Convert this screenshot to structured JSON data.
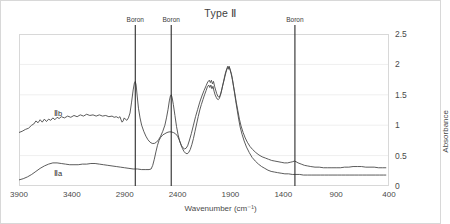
{
  "chart_data": {
    "type": "line",
    "title": "Type Ⅱ",
    "xlabel": "Wavenumber (cm⁻¹)",
    "ylabel": "Absorbance",
    "xlim": [
      3900,
      400
    ],
    "ylim": [
      0,
      2.5
    ],
    "x_ticks": [
      3900,
      3400,
      2900,
      2400,
      1900,
      1400,
      900,
      400
    ],
    "y_ticks": [
      0,
      0.5,
      1,
      1.5,
      2,
      2.5
    ],
    "x_reversed": true,
    "grid": "horizontal",
    "legend": "inline-labels",
    "annotations": [
      {
        "label": "Boron",
        "x": 2800,
        "type": "vertical-line"
      },
      {
        "label": "Boron",
        "x": 2460,
        "type": "vertical-line"
      },
      {
        "label": "Boron",
        "x": 1290,
        "type": "vertical-line"
      }
    ],
    "series": [
      {
        "name": "Ⅱb",
        "label_x": 3530,
        "label_y": 1.2,
        "noisy": true,
        "color": "#4a4a4a",
        "points": [
          [
            3900,
            0.88
          ],
          [
            3870,
            0.9
          ],
          [
            3840,
            0.93
          ],
          [
            3810,
            0.95
          ],
          [
            3780,
            1.0
          ],
          [
            3760,
            1.02
          ],
          [
            3740,
            1.07
          ],
          [
            3720,
            1.04
          ],
          [
            3700,
            1.09
          ],
          [
            3680,
            1.05
          ],
          [
            3660,
            1.1
          ],
          [
            3640,
            1.06
          ],
          [
            3620,
            1.1
          ],
          [
            3600,
            1.08
          ],
          [
            3580,
            1.12
          ],
          [
            3560,
            1.09
          ],
          [
            3540,
            1.13
          ],
          [
            3520,
            1.11
          ],
          [
            3500,
            1.14
          ],
          [
            3470,
            1.12
          ],
          [
            3440,
            1.15
          ],
          [
            3410,
            1.13
          ],
          [
            3380,
            1.16
          ],
          [
            3350,
            1.14
          ],
          [
            3320,
            1.17
          ],
          [
            3290,
            1.15
          ],
          [
            3260,
            1.18
          ],
          [
            3230,
            1.16
          ],
          [
            3200,
            1.17
          ],
          [
            3170,
            1.15
          ],
          [
            3140,
            1.17
          ],
          [
            3110,
            1.15
          ],
          [
            3080,
            1.16
          ],
          [
            3050,
            1.14
          ],
          [
            3020,
            1.15
          ],
          [
            3000,
            1.13
          ],
          [
            2980,
            1.14
          ],
          [
            2960,
            1.12
          ],
          [
            2945,
            1.14
          ],
          [
            2935,
            1.09
          ],
          [
            2925,
            1.05
          ],
          [
            2915,
            1.07
          ],
          [
            2905,
            1.12
          ],
          [
            2895,
            1.1
          ],
          [
            2880,
            1.08
          ],
          [
            2865,
            1.12
          ],
          [
            2850,
            1.2
          ],
          [
            2835,
            1.38
          ],
          [
            2820,
            1.58
          ],
          [
            2808,
            1.7
          ],
          [
            2800,
            1.72
          ],
          [
            2792,
            1.66
          ],
          [
            2782,
            1.48
          ],
          [
            2770,
            1.28
          ],
          [
            2755,
            1.12
          ],
          [
            2740,
            1.0
          ],
          [
            2720,
            0.9
          ],
          [
            2700,
            0.82
          ],
          [
            2680,
            0.76
          ],
          [
            2660,
            0.72
          ],
          [
            2640,
            0.7
          ],
          [
            2620,
            0.7
          ],
          [
            2600,
            0.72
          ],
          [
            2580,
            0.76
          ],
          [
            2560,
            0.82
          ],
          [
            2540,
            0.9
          ],
          [
            2520,
            1.0
          ],
          [
            2505,
            1.12
          ],
          [
            2490,
            1.26
          ],
          [
            2478,
            1.4
          ],
          [
            2468,
            1.48
          ],
          [
            2460,
            1.5
          ],
          [
            2452,
            1.46
          ],
          [
            2440,
            1.34
          ],
          [
            2425,
            1.16
          ],
          [
            2410,
            0.98
          ],
          [
            2395,
            0.84
          ],
          [
            2380,
            0.74
          ],
          [
            2365,
            0.67
          ],
          [
            2350,
            0.63
          ],
          [
            2335,
            0.61
          ],
          [
            2320,
            0.62
          ],
          [
            2305,
            0.66
          ],
          [
            2290,
            0.74
          ],
          [
            2270,
            0.86
          ],
          [
            2250,
            1.0
          ],
          [
            2230,
            1.14
          ],
          [
            2210,
            1.26
          ],
          [
            2190,
            1.38
          ],
          [
            2170,
            1.48
          ],
          [
            2150,
            1.57
          ],
          [
            2130,
            1.65
          ],
          [
            2115,
            1.71
          ],
          [
            2100,
            1.74
          ],
          [
            2090,
            1.7
          ],
          [
            2080,
            1.74
          ],
          [
            2070,
            1.68
          ],
          [
            2060,
            1.72
          ],
          [
            2050,
            1.64
          ],
          [
            2040,
            1.58
          ],
          [
            2030,
            1.52
          ],
          [
            2020,
            1.48
          ],
          [
            2010,
            1.46
          ],
          [
            2000,
            1.48
          ],
          [
            1990,
            1.53
          ],
          [
            1980,
            1.6
          ],
          [
            1970,
            1.68
          ],
          [
            1960,
            1.76
          ],
          [
            1950,
            1.84
          ],
          [
            1940,
            1.9
          ],
          [
            1932,
            1.94
          ],
          [
            1925,
            1.97
          ],
          [
            1918,
            1.94
          ],
          [
            1912,
            1.97
          ],
          [
            1905,
            1.93
          ],
          [
            1898,
            1.89
          ],
          [
            1890,
            1.84
          ],
          [
            1880,
            1.75
          ],
          [
            1870,
            1.64
          ],
          [
            1858,
            1.52
          ],
          [
            1845,
            1.38
          ],
          [
            1830,
            1.24
          ],
          [
            1815,
            1.1
          ],
          [
            1800,
            0.99
          ],
          [
            1780,
            0.88
          ],
          [
            1760,
            0.79
          ],
          [
            1740,
            0.72
          ],
          [
            1715,
            0.65
          ],
          [
            1690,
            0.6
          ],
          [
            1660,
            0.55
          ],
          [
            1630,
            0.51
          ],
          [
            1600,
            0.48
          ],
          [
            1570,
            0.46
          ],
          [
            1540,
            0.44
          ],
          [
            1510,
            0.42
          ],
          [
            1480,
            0.41
          ],
          [
            1450,
            0.4
          ],
          [
            1420,
            0.39
          ],
          [
            1390,
            0.38
          ],
          [
            1360,
            0.38
          ],
          [
            1335,
            0.39
          ],
          [
            1310,
            0.4
          ],
          [
            1295,
            0.41
          ],
          [
            1280,
            0.4
          ],
          [
            1260,
            0.38
          ],
          [
            1230,
            0.36
          ],
          [
            1200,
            0.34
          ],
          [
            1170,
            0.33
          ],
          [
            1140,
            0.32
          ],
          [
            1100,
            0.31
          ],
          [
            1060,
            0.31
          ],
          [
            1020,
            0.3
          ],
          [
            980,
            0.3
          ],
          [
            940,
            0.3
          ],
          [
            900,
            0.3
          ],
          [
            860,
            0.3
          ],
          [
            820,
            0.31
          ],
          [
            780,
            0.31
          ],
          [
            740,
            0.32
          ],
          [
            700,
            0.32
          ],
          [
            660,
            0.32
          ],
          [
            620,
            0.31
          ],
          [
            580,
            0.31
          ],
          [
            540,
            0.31
          ],
          [
            500,
            0.3
          ],
          [
            460,
            0.3
          ],
          [
            430,
            0.3
          ]
        ]
      },
      {
        "name": "Ⅱa",
        "label_x": 3530,
        "label_y": 0.22,
        "noisy": false,
        "color": "#4a4a4a",
        "points": [
          [
            3900,
            0.1
          ],
          [
            3860,
            0.12
          ],
          [
            3820,
            0.15
          ],
          [
            3780,
            0.19
          ],
          [
            3740,
            0.24
          ],
          [
            3700,
            0.29
          ],
          [
            3660,
            0.33
          ],
          [
            3620,
            0.36
          ],
          [
            3580,
            0.38
          ],
          [
            3540,
            0.38
          ],
          [
            3500,
            0.37
          ],
          [
            3460,
            0.36
          ],
          [
            3420,
            0.35
          ],
          [
            3380,
            0.35
          ],
          [
            3340,
            0.35
          ],
          [
            3300,
            0.36
          ],
          [
            3260,
            0.36
          ],
          [
            3220,
            0.37
          ],
          [
            3180,
            0.37
          ],
          [
            3140,
            0.36
          ],
          [
            3100,
            0.35
          ],
          [
            3060,
            0.34
          ],
          [
            3020,
            0.33
          ],
          [
            2980,
            0.32
          ],
          [
            2940,
            0.31
          ],
          [
            2900,
            0.3
          ],
          [
            2860,
            0.29
          ],
          [
            2820,
            0.28
          ],
          [
            2780,
            0.28
          ],
          [
            2740,
            0.27
          ],
          [
            2700,
            0.27
          ],
          [
            2670,
            0.27
          ],
          [
            2650,
            0.28
          ],
          [
            2635,
            0.34
          ],
          [
            2620,
            0.44
          ],
          [
            2605,
            0.56
          ],
          [
            2590,
            0.67
          ],
          [
            2575,
            0.75
          ],
          [
            2560,
            0.8
          ],
          [
            2540,
            0.84
          ],
          [
            2520,
            0.86
          ],
          [
            2500,
            0.88
          ],
          [
            2480,
            0.89
          ],
          [
            2460,
            0.89
          ],
          [
            2440,
            0.88
          ],
          [
            2420,
            0.86
          ],
          [
            2400,
            0.82
          ],
          [
            2385,
            0.76
          ],
          [
            2370,
            0.69
          ],
          [
            2355,
            0.62
          ],
          [
            2340,
            0.57
          ],
          [
            2325,
            0.54
          ],
          [
            2310,
            0.53
          ],
          [
            2295,
            0.55
          ],
          [
            2280,
            0.6
          ],
          [
            2265,
            0.68
          ],
          [
            2250,
            0.78
          ],
          [
            2235,
            0.9
          ],
          [
            2220,
            1.02
          ],
          [
            2205,
            1.14
          ],
          [
            2190,
            1.25
          ],
          [
            2175,
            1.34
          ],
          [
            2160,
            1.42
          ],
          [
            2145,
            1.5
          ],
          [
            2130,
            1.57
          ],
          [
            2118,
            1.63
          ],
          [
            2105,
            1.66
          ],
          [
            2095,
            1.62
          ],
          [
            2085,
            1.66
          ],
          [
            2075,
            1.6
          ],
          [
            2065,
            1.64
          ],
          [
            2055,
            1.56
          ],
          [
            2045,
            1.5
          ],
          [
            2035,
            1.46
          ],
          [
            2025,
            1.43
          ],
          [
            2015,
            1.42
          ],
          [
            2005,
            1.44
          ],
          [
            1995,
            1.49
          ],
          [
            1985,
            1.56
          ],
          [
            1975,
            1.64
          ],
          [
            1963,
            1.72
          ],
          [
            1952,
            1.8
          ],
          [
            1942,
            1.87
          ],
          [
            1933,
            1.92
          ],
          [
            1925,
            1.95
          ],
          [
            1917,
            1.92
          ],
          [
            1910,
            1.95
          ],
          [
            1902,
            1.9
          ],
          [
            1894,
            1.85
          ],
          [
            1885,
            1.78
          ],
          [
            1875,
            1.68
          ],
          [
            1863,
            1.55
          ],
          [
            1850,
            1.4
          ],
          [
            1836,
            1.25
          ],
          [
            1822,
            1.1
          ],
          [
            1808,
            0.97
          ],
          [
            1790,
            0.85
          ],
          [
            1770,
            0.74
          ],
          [
            1748,
            0.64
          ],
          [
            1722,
            0.55
          ],
          [
            1695,
            0.47
          ],
          [
            1665,
            0.41
          ],
          [
            1635,
            0.36
          ],
          [
            1605,
            0.32
          ],
          [
            1575,
            0.29
          ],
          [
            1545,
            0.26
          ],
          [
            1515,
            0.24
          ],
          [
            1485,
            0.23
          ],
          [
            1455,
            0.22
          ],
          [
            1420,
            0.21
          ],
          [
            1385,
            0.2
          ],
          [
            1350,
            0.2
          ],
          [
            1315,
            0.19
          ],
          [
            1280,
            0.19
          ],
          [
            1245,
            0.19
          ],
          [
            1210,
            0.18
          ],
          [
            1170,
            0.18
          ],
          [
            1130,
            0.18
          ],
          [
            1090,
            0.18
          ],
          [
            1050,
            0.18
          ],
          [
            1010,
            0.18
          ],
          [
            970,
            0.18
          ],
          [
            930,
            0.18
          ],
          [
            890,
            0.18
          ],
          [
            850,
            0.18
          ],
          [
            810,
            0.18
          ],
          [
            770,
            0.18
          ],
          [
            730,
            0.18
          ],
          [
            690,
            0.18
          ],
          [
            650,
            0.18
          ],
          [
            610,
            0.18
          ],
          [
            570,
            0.18
          ],
          [
            530,
            0.18
          ],
          [
            490,
            0.18
          ],
          [
            450,
            0.18
          ],
          [
            430,
            0.18
          ]
        ]
      }
    ]
  },
  "axis": {
    "y_tick_labels": [
      "0",
      "0.5",
      "1",
      "1.5",
      "2",
      "2.5"
    ],
    "x_tick_labels": [
      "3900",
      "3400",
      "2900",
      "2400",
      "1900",
      "1400",
      "900",
      "400"
    ]
  },
  "style": {
    "line_color": "#4a4a4a",
    "grid_color": "#efefef",
    "annotation_color": "#2b2b2b",
    "frame_color": "#d8d8d8"
  }
}
